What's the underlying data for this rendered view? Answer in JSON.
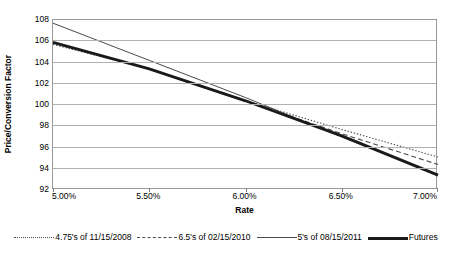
{
  "chart_data": {
    "type": "line",
    "title": "",
    "xlabel": "Rate",
    "ylabel": "Price/Conversion Factor",
    "xlim": [
      5.0,
      7.0
    ],
    "ylim": [
      92,
      108
    ],
    "xticks": [
      "5.00%",
      "5.50%",
      "6.00%",
      "6.50%",
      "7.00%"
    ],
    "xtick_values": [
      5.0,
      5.5,
      6.0,
      6.5,
      7.0
    ],
    "yticks": [
      "92",
      "94",
      "96",
      "98",
      "100",
      "102",
      "104",
      "106",
      "108"
    ],
    "ytick_values": [
      92,
      94,
      96,
      98,
      100,
      102,
      104,
      106,
      108
    ],
    "grid": true,
    "legend_position": "bottom",
    "x": [
      5.0,
      5.5,
      6.0,
      6.5,
      7.0
    ],
    "series": [
      {
        "name": "4.75's of 11/15/2008",
        "style": "dotted",
        "color": "#4a4a4a",
        "values": [
          105.7,
          103.4,
          100.4,
          97.7,
          95.1
        ]
      },
      {
        "name": "6.5's of 02/15/2010",
        "style": "dashed",
        "color": "#4a4a4a",
        "values": [
          105.9,
          103.4,
          100.4,
          97.3,
          94.4
        ]
      },
      {
        "name": "5's of 08/15/2011",
        "style": "solid",
        "color": "#4a4a4a",
        "values": [
          107.7,
          104.2,
          100.7,
          97.0,
          93.4
        ]
      },
      {
        "name": "Futures",
        "style": "thick-solid",
        "color": "#1a1a1a",
        "values": [
          105.9,
          103.4,
          100.4,
          97.1,
          93.4
        ]
      }
    ]
  },
  "axes": {
    "y_title": "Price/Conversion Factor",
    "x_title": "Rate"
  },
  "legend": {
    "items": [
      {
        "label": "4.75's of 11/15/2008",
        "swatch": "dotted-line-swatch"
      },
      {
        "label": "6.5's of 02/15/2010",
        "swatch": "dashed-line-swatch"
      },
      {
        "label": "5's of 08/15/2011",
        "swatch": "solid-line-swatch"
      },
      {
        "label": "Futures",
        "swatch": "thick-line-swatch"
      }
    ]
  }
}
